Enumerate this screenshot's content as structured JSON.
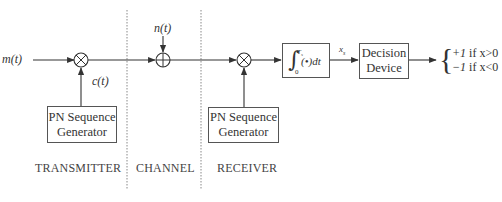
{
  "diagram": {
    "sections": [
      {
        "id": "transmitter",
        "label": "TRANSMITTER"
      },
      {
        "id": "channel",
        "label": "CHANNEL"
      },
      {
        "id": "receiver",
        "label": "RECEIVER"
      }
    ],
    "signals": {
      "input": "m(t)",
      "chip": "c(t)",
      "noise": "n(t)",
      "integrator_out": "x",
      "integrator_out_sub": "s"
    },
    "blocks": {
      "tx_pn": {
        "line1": "PN Sequence",
        "line2": "Generator"
      },
      "rx_pn": {
        "line1": "PN Sequence",
        "line2": "Generator"
      },
      "integrator": {
        "label": "∫(•)dt",
        "lower_limit": "0",
        "upper_limit": "T",
        "upper_sub": "s"
      },
      "decision": {
        "line1": "Decision",
        "line2": "Device"
      }
    },
    "operators": {
      "tx_mult": "multiplier (⊗)",
      "channel_add": "adder (⊕)",
      "rx_mult": "multiplier (⊗)"
    },
    "output": {
      "case1_value": "+1",
      "case1_cond": " if x>0",
      "case2_value": "−1",
      "case2_cond": " if x<0"
    },
    "colors": {
      "line": "#333333",
      "divider": "#888888",
      "text": "#333333"
    }
  }
}
